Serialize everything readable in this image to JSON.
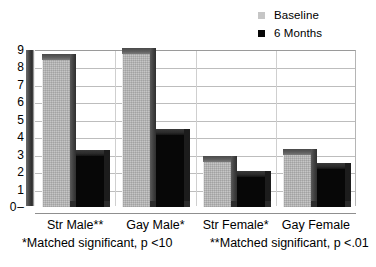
{
  "chart_data": {
    "type": "bar",
    "title": "",
    "subtitle": "",
    "xlabel": "",
    "ylabel": "",
    "ylim": [
      0,
      9
    ],
    "yticks": [
      0,
      1,
      2,
      3,
      4,
      5,
      6,
      7,
      8,
      9
    ],
    "grid": true,
    "legend_position": "top-right",
    "style": "3d-clustered-column",
    "categories": [
      "Str Male**",
      "Gay Male*",
      "Str Female*",
      "Gay Female"
    ],
    "series": [
      {
        "name": "Baseline",
        "color": "#c6c6c6",
        "values": [
          8.4,
          8.8,
          2.6,
          3.0
        ]
      },
      {
        "name": "6 Months",
        "color": "#070707",
        "values": [
          2.9,
          4.1,
          1.7,
          2.2
        ]
      }
    ],
    "annotations": [
      "*Matched significant, p <10",
      "**Matched significant, p <.01"
    ]
  },
  "legend": {
    "items": [
      {
        "label": "Baseline",
        "swatch_color": "#c6c6c6"
      },
      {
        "label": "6 Months",
        "swatch_color": "#070707"
      }
    ]
  },
  "axis": {
    "y_ticks": [
      "9",
      "8",
      "7",
      "6",
      "5",
      "4",
      "3",
      "2",
      "1",
      "0"
    ]
  },
  "x_labels": [
    "Str Male**",
    "Gay Male*",
    "Str Female*",
    "Gay Female"
  ],
  "footnotes": [
    "*Matched significant, p <10",
    "**Matched significant, p <.01"
  ]
}
